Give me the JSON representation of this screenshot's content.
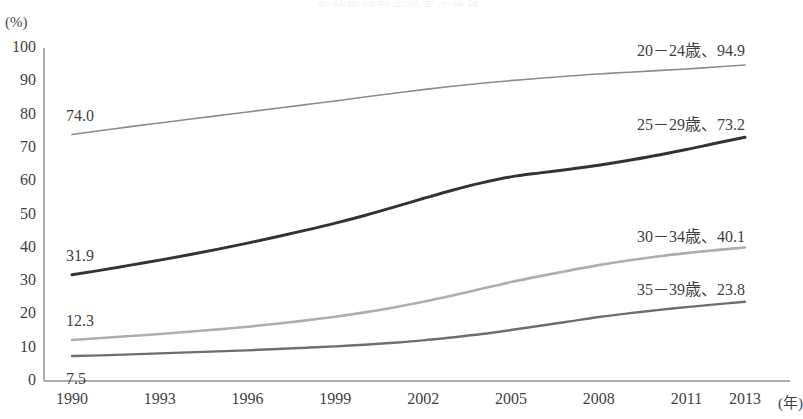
{
  "chart_data": {
    "type": "line",
    "title": "年齢階級別未婚率の推移",
    "xlabel": "(年)",
    "ylabel": "(%)",
    "xlim": [
      1990,
      2013
    ],
    "ylim": [
      0,
      100
    ],
    "grid": false,
    "legend_position": "inline-right",
    "x_ticks": [
      "1990",
      "1993",
      "1996",
      "1999",
      "2002",
      "2005",
      "2008",
      "2011",
      "2013"
    ],
    "x_tick_values": [
      1990,
      1993,
      1996,
      1999,
      2002,
      2005,
      2008,
      2011,
      2013
    ],
    "y_ticks": [
      "0",
      "10",
      "20",
      "30",
      "40",
      "50",
      "60",
      "70",
      "80",
      "90",
      "100"
    ],
    "y_tick_values": [
      0,
      10,
      20,
      30,
      40,
      50,
      60,
      70,
      80,
      90,
      100
    ],
    "x": [
      1990,
      1991,
      1992,
      1993,
      1994,
      1995,
      1996,
      1997,
      1998,
      1999,
      2000,
      2001,
      2002,
      2003,
      2004,
      2005,
      2006,
      2007,
      2008,
      2009,
      2010,
      2011,
      2012,
      2013
    ],
    "series": [
      {
        "name": "20－24歳",
        "start_value": 74.0,
        "end_value": 94.9,
        "start_label": "74.0",
        "end_label": "20－24歳、94.9",
        "color": "#8c8c8c",
        "width": 1.6,
        "values": [
          74.0,
          75.2,
          76.4,
          77.5,
          78.6,
          79.7,
          80.8,
          81.9,
          83.0,
          84.1,
          85.3,
          86.4,
          87.5,
          88.5,
          89.4,
          90.2,
          90.9,
          91.6,
          92.2,
          92.7,
          93.2,
          93.7,
          94.3,
          94.9
        ]
      },
      {
        "name": "25－29歳",
        "start_value": 31.9,
        "end_value": 73.2,
        "start_label": "31.9",
        "end_label": "25－29歳、73.2",
        "color": "#333333",
        "width": 3.0,
        "values": [
          31.9,
          33.3,
          34.8,
          36.3,
          37.9,
          39.6,
          41.4,
          43.3,
          45.3,
          47.4,
          49.7,
          52.2,
          54.8,
          57.3,
          59.5,
          61.3,
          62.5,
          63.6,
          64.8,
          66.2,
          67.8,
          69.5,
          71.4,
          73.2
        ]
      },
      {
        "name": "30－34歳",
        "start_value": 12.3,
        "end_value": 40.1,
        "start_label": "12.3",
        "end_label": "30－34歳、40.1",
        "color": "#aeaeae",
        "width": 2.6,
        "values": [
          12.3,
          12.9,
          13.5,
          14.1,
          14.8,
          15.5,
          16.3,
          17.2,
          18.2,
          19.3,
          20.6,
          22.1,
          23.8,
          25.7,
          27.7,
          29.7,
          31.5,
          33.2,
          34.8,
          36.2,
          37.4,
          38.4,
          39.3,
          40.1
        ]
      },
      {
        "name": "35－39歳",
        "start_value": 7.5,
        "end_value": 23.8,
        "start_label": "7.5",
        "end_label": "35－39歳、23.8",
        "color": "#6e6e6e",
        "width": 2.4,
        "values": [
          7.5,
          7.7,
          8.0,
          8.3,
          8.6,
          8.9,
          9.2,
          9.6,
          10.0,
          10.4,
          10.9,
          11.5,
          12.2,
          13.1,
          14.1,
          15.3,
          16.6,
          17.9,
          19.2,
          20.3,
          21.3,
          22.2,
          23.0,
          23.8
        ]
      }
    ]
  },
  "axis": {
    "unit_y": "(%)",
    "unit_x": "(年)"
  }
}
